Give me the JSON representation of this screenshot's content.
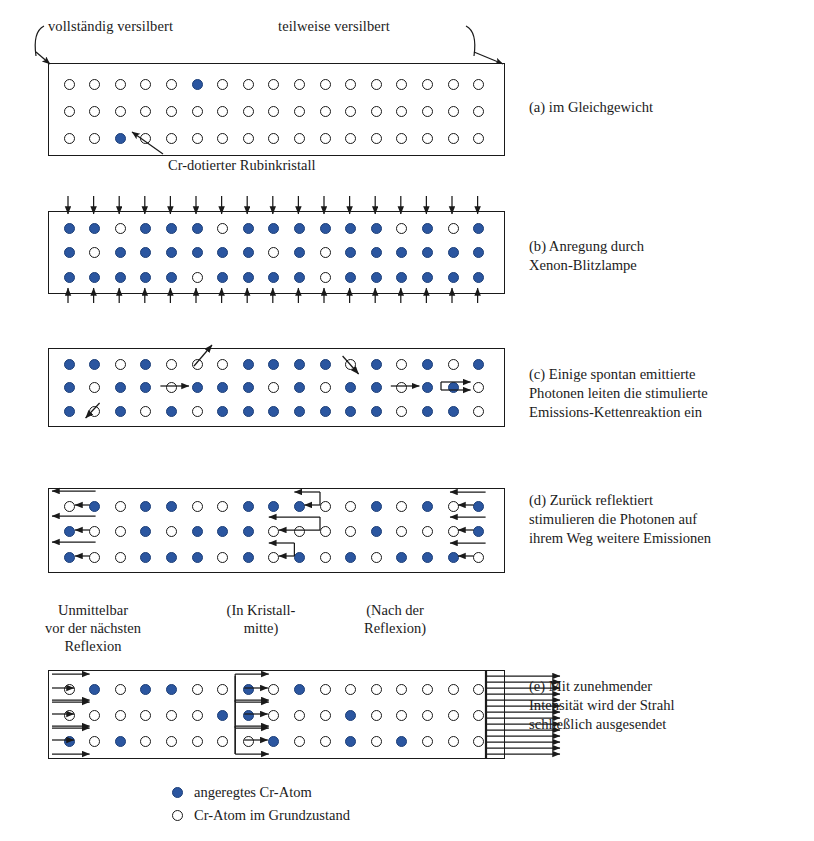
{
  "figure": {
    "title_top_left": "vollständig versilbert",
    "title_top_right": "teilweise versilbert",
    "pointer_label": "Cr-dotierter Rubinkristall"
  },
  "colors": {
    "excited_atom": "#2b56a0",
    "ground_atom": "#ffffff",
    "outline": "#1a1a1a",
    "background": "#ffffff"
  },
  "legend": {
    "items": [
      {
        "state": "excited",
        "label": "angeregtes Cr-Atom"
      },
      {
        "state": "ground",
        "label": "Cr-Atom im Grundzustand"
      }
    ]
  },
  "panel_labels_under_d": [
    "Unmittelbar\nvor der nächsten\nReflexion",
    "(In Kristall-\nmitte)",
    "(Nach der\nReflexion)"
  ],
  "panels": [
    {
      "id": "a",
      "caption": "(a) im Gleichgewicht",
      "columns": 17,
      "rows": [
        "ooooo*oooooooooooo",
        "ooooooooooooooooo",
        "oo*oooooooooooooo"
      ]
    },
    {
      "id": "b",
      "caption": "(b) Anregung durch\nXenon-Blitzlampe",
      "columns": 17,
      "rows": [
        "**o***o******o*o*",
        "*o******o*o******",
        "*****o****o******"
      ],
      "pump_arrows": {
        "top": 17,
        "bottom": 17,
        "direction": "inward"
      }
    },
    {
      "id": "c",
      "caption": "(c) Einige spontan emittierte\nPhotonen leiten die stimulierte\nEmissions-Kettenreaktion ein",
      "columns": 17,
      "rows": [
        "**o*ooo****o*o*o*",
        "*o**o***o*o**o**o*",
        "*o*o*o*******o**o"
      ],
      "photon_events": [
        {
          "row": 0,
          "col": 5,
          "type": "spontaneous-up-right"
        },
        {
          "row": 0,
          "col": 11,
          "type": "spontaneous-down-right"
        },
        {
          "row": 1,
          "col": 4,
          "type": "stimulated-right"
        },
        {
          "row": 1,
          "col": 13,
          "type": "stimulated-right"
        },
        {
          "row": 1,
          "col": 15,
          "type": "stimulated-double-right"
        },
        {
          "row": 2,
          "col": 1,
          "type": "spontaneous-up-left"
        }
      ]
    },
    {
      "id": "d",
      "caption": "(d) Zurück reflektiert\nstimulieren die Photonen auf\nihrem Weg weitere Emissionen",
      "columns": 17,
      "rows": [
        "o*o**oo***oo*o*o*",
        "*oo*o***oooo*ooo*o",
        "*oo***o*o*o*o***oo"
      ],
      "photon_direction": "leftward"
    },
    {
      "id": "e",
      "caption": "(e) Mit zunehmender\nIntensität wird der Strahl\nschließlich ausgesendet",
      "columns": 17,
      "rows": [
        "o*o**oo*o*ooooooo",
        "oooooo**ooo*ooooo",
        "*o*ooooo*oo*o*oo",
        ""
      ],
      "photon_direction": "rightward",
      "output_beam": true
    }
  ]
}
